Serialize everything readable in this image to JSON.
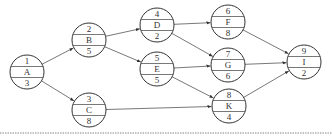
{
  "diagram": {
    "type": "activity-on-node network",
    "colors": {
      "stroke": "#333333",
      "text": "#333333",
      "background": "#ffffff",
      "dotted_line": "#888888"
    },
    "node_radius": 17,
    "nodes": [
      {
        "id": "A",
        "top": "1",
        "label": "A",
        "bottom": "3",
        "x": 27,
        "y": 72
      },
      {
        "id": "B",
        "top": "2",
        "label": "B",
        "bottom": "5",
        "x": 89,
        "y": 40
      },
      {
        "id": "C",
        "top": "3",
        "label": "C",
        "bottom": "8",
        "x": 89,
        "y": 110
      },
      {
        "id": "D",
        "top": "4",
        "label": "D",
        "bottom": "2",
        "x": 157,
        "y": 25
      },
      {
        "id": "E",
        "top": "5",
        "label": "E",
        "bottom": "5",
        "x": 157,
        "y": 69
      },
      {
        "id": "F",
        "top": "6",
        "label": "F",
        "bottom": "8",
        "x": 228,
        "y": 22
      },
      {
        "id": "G",
        "top": "7",
        "label": "G",
        "bottom": "6",
        "x": 228,
        "y": 65
      },
      {
        "id": "K",
        "top": "8",
        "label": "K",
        "bottom": "4",
        "x": 229,
        "y": 106
      },
      {
        "id": "I",
        "top": "9",
        "label": "I",
        "bottom": "2",
        "x": 304,
        "y": 62
      }
    ],
    "edges": [
      {
        "from": "A",
        "to": "B"
      },
      {
        "from": "A",
        "to": "C"
      },
      {
        "from": "B",
        "to": "D"
      },
      {
        "from": "B",
        "to": "E"
      },
      {
        "from": "C",
        "to": "K"
      },
      {
        "from": "D",
        "to": "F"
      },
      {
        "from": "D",
        "to": "G"
      },
      {
        "from": "E",
        "to": "G"
      },
      {
        "from": "E",
        "to": "K"
      },
      {
        "from": "F",
        "to": "I"
      },
      {
        "from": "G",
        "to": "I"
      },
      {
        "from": "K",
        "to": "I"
      }
    ],
    "dotted_baseline_y": 133
  }
}
